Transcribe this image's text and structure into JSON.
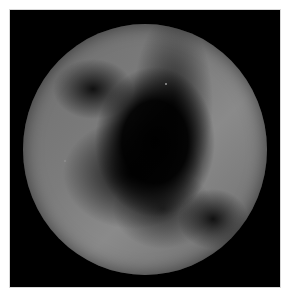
{
  "image": {
    "description": "Grayscale circular disk on black background",
    "colors": {
      "background": "#000000",
      "disk_light": "#8a8a8a",
      "disk_dark": "#050505",
      "border": "#d8d8d8"
    }
  }
}
